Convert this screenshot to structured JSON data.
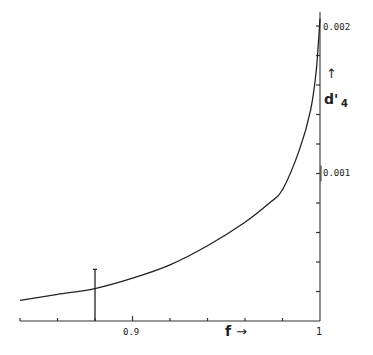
{
  "chart_data": {
    "type": "line",
    "title": "",
    "xlabel": "f",
    "ylabel": "d'4",
    "xlabel_arrow": "→",
    "ylabel_arrow": "↑",
    "xlim": [
      0.84,
      1.0
    ],
    "ylim": [
      0,
      0.002
    ],
    "x_ticks": [
      0.84,
      0.86,
      0.88,
      0.9,
      0.92,
      0.94,
      0.96,
      0.98,
      1.0
    ],
    "x_tick_labels": [
      {
        "value": 0.9,
        "label": "0.9"
      },
      {
        "value": 1.0,
        "label": "1"
      }
    ],
    "y_ticks": [
      0,
      0.0002,
      0.0004,
      0.0006,
      0.0008,
      0.001,
      0.0012,
      0.0014,
      0.0016,
      0.0018,
      0.002
    ],
    "y_tick_labels": [
      {
        "value": 0.001,
        "label": "0.001"
      },
      {
        "value": 0.002,
        "label": "0.002"
      }
    ],
    "y_axis_position": "right",
    "grid": false,
    "legend": null,
    "series": [
      {
        "name": "d'4",
        "x": [
          0.84,
          0.86,
          0.88,
          0.9,
          0.92,
          0.94,
          0.96,
          0.973,
          0.98,
          0.989,
          0.995,
          0.998,
          1.0
        ],
        "y": [
          0.00014,
          0.00018,
          0.00022,
          0.00029,
          0.00038,
          0.00051,
          0.00067,
          0.0008,
          0.00089,
          0.00116,
          0.00143,
          0.0017,
          0.00205
        ]
      }
    ],
    "error_bars": [
      {
        "x": 0.88,
        "y_low": 0,
        "y_high": 0.00035
      }
    ]
  },
  "labels": {
    "x_title": "f",
    "x_arrow": "→",
    "y_title": "d'",
    "y_sub": "4",
    "y_arrow": "↑",
    "x_tick_09": "0.9",
    "x_tick_1": "1",
    "y_tick_0001": "0.001",
    "y_tick_0002": "0.002"
  }
}
